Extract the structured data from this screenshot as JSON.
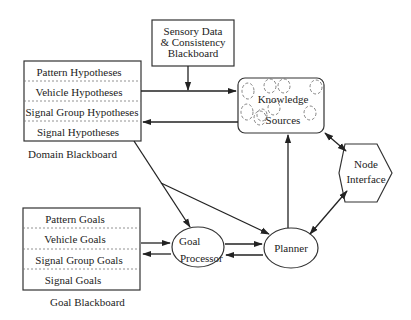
{
  "diagram": {
    "sensory_blackboard": {
      "lines": [
        "Sensory Data",
        "& Consistency",
        "Blackboard"
      ]
    },
    "domain_blackboard": {
      "label": "Domain  Blackboard",
      "levels": [
        "Pattern Hypotheses",
        "Vehicle Hypotheses",
        "Signal Group Hypotheses",
        "Signal Hypotheses"
      ]
    },
    "knowledge_sources": {
      "lines": [
        "Knowledge",
        "Sources"
      ]
    },
    "node_interface": {
      "lines": [
        "Node",
        "Interface"
      ]
    },
    "goal_blackboard": {
      "label": "Goal  Blackboard",
      "levels": [
        "Pattern Goals",
        "Vehicle Goals",
        "Signal Group Goals",
        "Signal Goals"
      ]
    },
    "goal_processor": {
      "lines": [
        "Goal",
        "Processor"
      ]
    },
    "planner": {
      "label": "Planner"
    },
    "edges": [
      {
        "from": "Sensory Data & Consistency Blackboard",
        "to": "Knowledge Sources"
      },
      {
        "from": "Domain Blackboard",
        "to": "Knowledge Sources"
      },
      {
        "from": "Knowledge Sources",
        "to": "Domain Blackboard"
      },
      {
        "from": "Knowledge Sources",
        "to": "Node Interface",
        "bidirectional": true
      },
      {
        "from": "Planner",
        "to": "Knowledge Sources"
      },
      {
        "from": "Planner",
        "to": "Node Interface",
        "bidirectional": true
      },
      {
        "from": "Domain Blackboard",
        "to": "Goal Processor"
      },
      {
        "from": "Domain Blackboard",
        "to": "Planner"
      },
      {
        "from": "Goal Blackboard",
        "to": "Goal Processor"
      },
      {
        "from": "Goal Processor",
        "to": "Goal Blackboard"
      },
      {
        "from": "Goal Processor",
        "to": "Planner"
      },
      {
        "from": "Planner",
        "to": "Goal Processor"
      }
    ]
  }
}
